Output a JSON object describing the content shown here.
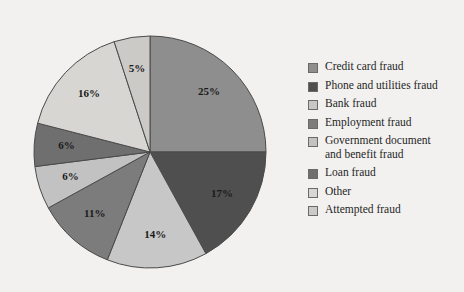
{
  "chart_data": {
    "type": "pie",
    "title": "",
    "categories": [
      "Credit card fraud",
      "Phone and utilities fraud",
      "Bank fraud",
      "Employment fraud",
      "Government document and benefit fraud",
      "Loan fraud",
      "Other",
      "Attempted fraud"
    ],
    "values": [
      25,
      17,
      14,
      11,
      6,
      6,
      16,
      5
    ],
    "value_labels": [
      "25%",
      "17%",
      "14%",
      "11%",
      "6%",
      "6%",
      "16%",
      "5%"
    ],
    "colors": [
      "#8e8e8e",
      "#4f4f4f",
      "#c7c7c7",
      "#7c7c7c",
      "#c2c2c2",
      "#6f6f6f",
      "#d7d6d3",
      "#cbcac7"
    ],
    "units": "percent",
    "start_angle_deg": 0,
    "direction": "clockwise",
    "legend_position": "right",
    "grid": false,
    "background": "#f2f1ef",
    "label_color": "#1a1a1a",
    "slice_border_color": "#4a4a4a"
  },
  "legend": {
    "items": [
      {
        "label": "Credit card fraud",
        "color": "#8e8e8e"
      },
      {
        "label": "Phone and utilities fraud",
        "color": "#4f4f4f"
      },
      {
        "label": "Bank fraud",
        "color": "#c7c7c7"
      },
      {
        "label": "Employment fraud",
        "color": "#7c7c7c"
      },
      {
        "label": "Government document\nand benefit fraud",
        "color": "#c2c2c2"
      },
      {
        "label": "Loan fraud",
        "color": "#6f6f6f"
      },
      {
        "label": "Other",
        "color": "#d7d6d3"
      },
      {
        "label": "Attempted fraud",
        "color": "#cbcac7"
      }
    ]
  },
  "geometry": {
    "cx": 150,
    "cy": 152,
    "r": 116,
    "label_radius_ratio": 0.72
  }
}
